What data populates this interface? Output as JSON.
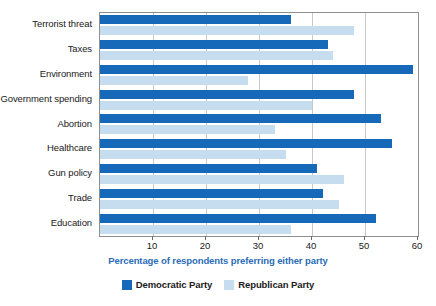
{
  "chart_data": {
    "type": "bar",
    "orientation": "horizontal",
    "title": "",
    "xlabel": "Percentage of respondents preferring either party",
    "ylabel": "",
    "xlim": [
      0,
      60
    ],
    "xticks": [
      10,
      20,
      30,
      40,
      50,
      60
    ],
    "xtick_labels": [
      "10",
      "20",
      "30",
      "40",
      "50",
      "60"
    ],
    "grid": "vertical",
    "legend_position": "bottom-center",
    "categories": [
      "Terrorist threat",
      "Taxes",
      "Environment",
      "Government spending",
      "Abortion",
      "Healthcare",
      "Gun policy",
      "Trade",
      "Education"
    ],
    "series": [
      {
        "name": "Democratic Party",
        "color": "#1668b8",
        "values": [
          36,
          43,
          59,
          48,
          53,
          55,
          41,
          42,
          52
        ]
      },
      {
        "name": "Republican Party",
        "color": "#c6ddf0",
        "values": [
          48,
          44,
          28,
          40,
          33,
          35,
          46,
          45,
          36
        ]
      }
    ]
  },
  "colors": {
    "democratic": "#1668b8",
    "republican": "#c6ddf0",
    "axis_title": "#2b6cb8",
    "grid": "#c9c9c9",
    "frame": "#8e8e8e"
  }
}
